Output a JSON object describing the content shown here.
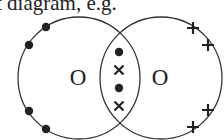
{
  "caption": "t diagram, e.g.",
  "diagram": {
    "type": "dot-and-cross",
    "molecule": "O2",
    "atoms": [
      {
        "label": "O",
        "center": [
          79,
          78
        ],
        "radius": 61,
        "electron_symbol": "dot"
      },
      {
        "label": "O",
        "center": [
          161,
          78
        ],
        "radius": 61,
        "electron_symbol": "cross"
      }
    ],
    "left_nonbonding_dots": [
      [
        46,
        27
      ],
      [
        29,
        45
      ],
      [
        29,
        111
      ],
      [
        46,
        129
      ]
    ],
    "right_nonbonding_crosses": [
      [
        193,
        28
      ],
      [
        208,
        45
      ],
      [
        208,
        110
      ],
      [
        193,
        127
      ]
    ],
    "shared_pairs": [
      {
        "symbol": "dot",
        "pos": [
          119,
          52
        ]
      },
      {
        "symbol": "cross",
        "pos": [
          119,
          70
        ]
      },
      {
        "symbol": "dot",
        "pos": [
          119,
          88
        ]
      },
      {
        "symbol": "cross",
        "pos": [
          119,
          106
        ]
      }
    ],
    "colors": {
      "line": "#333333",
      "electron": "#222222",
      "background": "#ffffff"
    }
  }
}
